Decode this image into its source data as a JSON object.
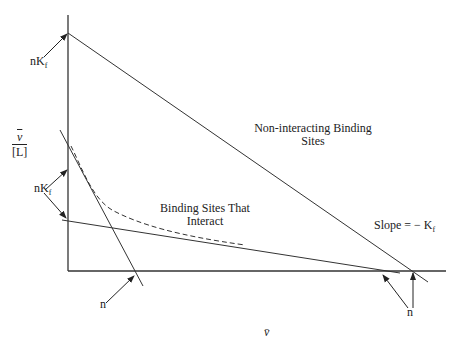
{
  "diagram": {
    "type": "scatchard_plot",
    "axes": {
      "x_label": "v̄",
      "y_label_numerator": "v",
      "y_label_denominator": "[L]"
    },
    "labels": {
      "nKf_top": {
        "n": "nK",
        "sub": "f"
      },
      "nKf_middle": {
        "n": "nK",
        "sub": "f"
      },
      "n_left": "n",
      "n_right": "n",
      "non_interacting_line1": "Non-interacting Binding",
      "non_interacting_line2": "Sites",
      "interacting_line1": "Binding Sites That",
      "interacting_line2": "Interact",
      "slope_text": "Slope = − K",
      "slope_sub": "f"
    },
    "colors": {
      "line": "#333333",
      "background": "#ffffff"
    }
  }
}
